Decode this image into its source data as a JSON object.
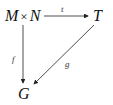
{
  "diagram": {
    "type": "commutative-diagram",
    "nodes": {
      "source": {
        "left": "M",
        "op": "×",
        "right": "N"
      },
      "target_top": "T",
      "target_bottom": "G"
    },
    "arrows": [
      {
        "id": "t",
        "from": "M × N",
        "to": "T",
        "label": "t"
      },
      {
        "id": "f",
        "from": "M × N",
        "to": "G",
        "label": "f"
      },
      {
        "id": "g",
        "from": "T",
        "to": "G",
        "label": "g"
      }
    ],
    "colors": {
      "stroke": "#222222"
    }
  }
}
